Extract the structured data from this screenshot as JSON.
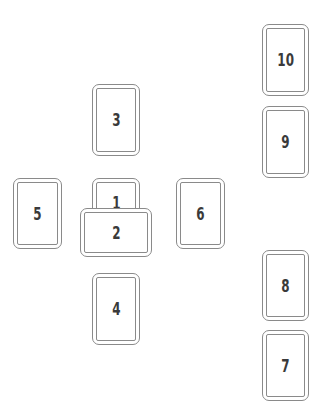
{
  "diagram": {
    "type": "tarot-spread",
    "cards": [
      {
        "position": 1,
        "label": "1",
        "x": 92,
        "y": 178,
        "w": 48,
        "h": 72,
        "orientation": "vertical"
      },
      {
        "position": 2,
        "label": "2",
        "x": 80,
        "y": 208,
        "w": 72,
        "h": 49,
        "orientation": "horizontal"
      },
      {
        "position": 3,
        "label": "3",
        "x": 92,
        "y": 84,
        "w": 48,
        "h": 72,
        "orientation": "vertical"
      },
      {
        "position": 4,
        "label": "4",
        "x": 92,
        "y": 273,
        "w": 48,
        "h": 72,
        "orientation": "vertical"
      },
      {
        "position": 5,
        "label": "5",
        "x": 13,
        "y": 178,
        "w": 49,
        "h": 71,
        "orientation": "vertical"
      },
      {
        "position": 6,
        "label": "6",
        "x": 176,
        "y": 178,
        "w": 49,
        "h": 71,
        "orientation": "vertical"
      },
      {
        "position": 7,
        "label": "7",
        "x": 262,
        "y": 330,
        "w": 47,
        "h": 71,
        "orientation": "vertical"
      },
      {
        "position": 8,
        "label": "8",
        "x": 262,
        "y": 250,
        "w": 47,
        "h": 71,
        "orientation": "vertical"
      },
      {
        "position": 9,
        "label": "9",
        "x": 262,
        "y": 106,
        "w": 47,
        "h": 72,
        "orientation": "vertical"
      },
      {
        "position": 10,
        "label": "10",
        "x": 262,
        "y": 24,
        "w": 47,
        "h": 72,
        "orientation": "vertical"
      }
    ]
  }
}
